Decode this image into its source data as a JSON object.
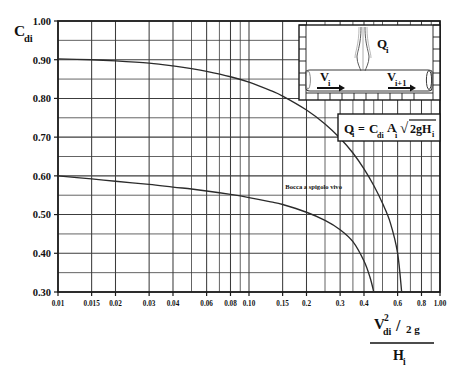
{
  "figure": {
    "background_color": "#ffffff",
    "axis_color": "#1a1a1a",
    "grid_color": "#3c3c3c",
    "curve_color": "#2b2b2b"
  },
  "ylabel": {
    "main": "C",
    "sub": "di"
  },
  "xlabel": {
    "numerator_main": "V",
    "numerator_sup": "2",
    "numerator_sub": "di",
    "numerator_divider": "/",
    "numerator_tail": "2 g",
    "denominator_main": "H",
    "denominator_sub": "i"
  },
  "equation_box": {
    "lhs_main": "Q",
    "lhs_sub": "i",
    "equals": "=",
    "c_main": "C",
    "c_sub": "di",
    "a_main": "A",
    "a_sub": "i",
    "radical": "√",
    "radicand_main": "2gH",
    "radicand_sub": "i"
  },
  "inset": {
    "flow_label_main": "Q",
    "flow_label_sub": "i",
    "left_velocity_main": "V",
    "left_velocity_sub": "i",
    "right_velocity_main": "V",
    "right_velocity_sub": "i+1"
  },
  "annotations": [
    {
      "name": "curve-label-sharp-edged-orifice",
      "text": "Bocca a spigolo vivo",
      "x": 0.155,
      "y": 0.565
    }
  ],
  "chart_data": {
    "type": "line",
    "title": "",
    "subtitle": "",
    "xlabel": "V^2_di / 2g / H_i",
    "ylabel": "C_di",
    "xscale": "log",
    "yscale": "linear",
    "xlim": [
      0.01,
      1.0
    ],
    "ylim": [
      0.3,
      1.0
    ],
    "grid": true,
    "legend": "none",
    "x_ticks": [
      0.01,
      0.015,
      0.02,
      0.03,
      0.04,
      0.06,
      0.08,
      0.1,
      0.15,
      0.2,
      0.3,
      0.4,
      0.6,
      0.8,
      1.0
    ],
    "x_tick_labels": [
      "0.01",
      "0.015",
      "0.02",
      "0.03",
      "0.04",
      "0.06",
      "0.08",
      "0.10",
      "0.15",
      "0.2",
      "0.3",
      "0.4",
      "0.6",
      "0.8",
      "1.00"
    ],
    "x_minor_gridlines": [
      0.01,
      0.015,
      0.02,
      0.03,
      0.04,
      0.05,
      0.06,
      0.07,
      0.08,
      0.09,
      0.1,
      0.15,
      0.2,
      0.25,
      0.3,
      0.35,
      0.4,
      0.45,
      0.5,
      0.6,
      0.7,
      0.8,
      0.9,
      1.0
    ],
    "y_ticks": [
      0.3,
      0.4,
      0.5,
      0.6,
      0.7,
      0.8,
      0.9,
      1.0
    ],
    "y_tick_labels": [
      "0.30",
      "0.40",
      "0.50",
      "0.60",
      "0.70",
      "0.80",
      "0.90",
      "1.00"
    ],
    "y_minor_gridlines": [
      0.3,
      0.35,
      0.4,
      0.45,
      0.5,
      0.55,
      0.6,
      0.65,
      0.7,
      0.75,
      0.8,
      0.85,
      0.9,
      0.95,
      1.0
    ],
    "series": [
      {
        "name": "upper-curve",
        "label": "",
        "x": [
          0.01,
          0.015,
          0.02,
          0.03,
          0.04,
          0.05,
          0.06,
          0.08,
          0.1,
          0.13,
          0.15,
          0.2,
          0.25,
          0.3,
          0.35,
          0.4,
          0.45,
          0.5,
          0.55,
          0.6,
          0.63
        ],
        "y": [
          0.902,
          0.9,
          0.897,
          0.891,
          0.884,
          0.877,
          0.87,
          0.856,
          0.842,
          0.82,
          0.806,
          0.77,
          0.734,
          0.697,
          0.659,
          0.618,
          0.575,
          0.529,
          0.478,
          0.4,
          0.3
        ]
      },
      {
        "name": "lower-curve",
        "label": "Bocca a spigolo vivo",
        "x": [
          0.01,
          0.015,
          0.02,
          0.03,
          0.04,
          0.05,
          0.06,
          0.08,
          0.1,
          0.13,
          0.15,
          0.2,
          0.25,
          0.3,
          0.35,
          0.4,
          0.43,
          0.45
        ],
        "y": [
          0.6,
          0.592,
          0.586,
          0.578,
          0.571,
          0.566,
          0.561,
          0.552,
          0.544,
          0.533,
          0.526,
          0.506,
          0.485,
          0.461,
          0.43,
          0.38,
          0.338,
          0.3
        ]
      }
    ]
  }
}
